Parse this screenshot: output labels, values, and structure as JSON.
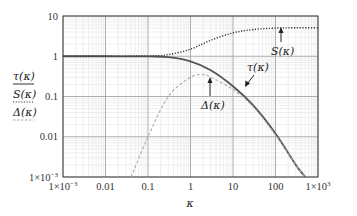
{
  "chart_data": {
    "type": "line",
    "title": "",
    "xlabel": "κ",
    "ylabel": "",
    "xscale": "log",
    "yscale": "log",
    "xlim": [
      0.001,
      1000
    ],
    "ylim": [
      0.001,
      10
    ],
    "grid": "major and minor",
    "x_ticks": [
      "1×10⁻³",
      "0.01",
      "0.1",
      "1",
      "10",
      "100",
      "1×10³"
    ],
    "y_ticks": [
      "10",
      "1",
      "0.1",
      "0.01",
      "1×10⁻³"
    ],
    "legend": {
      "position": "left of axes",
      "entries": [
        {
          "label": "τ(κ)",
          "style": "solid"
        },
        {
          "label": "S(κ)",
          "style": "dotted"
        },
        {
          "label": "Δ(κ)",
          "style": "dashed"
        }
      ]
    },
    "series": [
      {
        "name": "τ(κ)",
        "style": "solid",
        "color": "#555555",
        "x": [
          0.001,
          0.01,
          0.1,
          0.3,
          1,
          3,
          10,
          30,
          100,
          300,
          500
        ],
        "y": [
          1,
          1,
          0.99,
          0.95,
          0.75,
          0.45,
          0.18,
          0.06,
          0.012,
          0.002,
          0.001
        ]
      },
      {
        "name": "S(κ)",
        "style": "dotted",
        "color": "#333333",
        "x": [
          0.001,
          0.1,
          0.3,
          1,
          3,
          10,
          30,
          100,
          300,
          1000
        ],
        "y": [
          1,
          1.02,
          1.1,
          1.5,
          2.5,
          3.8,
          4.6,
          5.0,
          5.1,
          5.1
        ]
      },
      {
        "name": "Δ(κ)",
        "style": "dashed",
        "color": "#aaaaaa",
        "x": [
          0.04,
          0.1,
          0.3,
          1,
          2,
          3,
          10,
          30,
          100,
          300,
          500
        ],
        "y": [
          0.001,
          0.01,
          0.1,
          0.3,
          0.35,
          0.3,
          0.15,
          0.055,
          0.011,
          0.002,
          0.001
        ]
      }
    ],
    "annotations": [
      {
        "text": "S(κ)",
        "arrow_to": [
          100,
          5.0
        ]
      },
      {
        "text": "τ(κ)",
        "arrow_to": [
          10,
          0.2
        ]
      },
      {
        "text": "Δ(κ)",
        "arrow_to": [
          2,
          0.35
        ]
      }
    ]
  },
  "labels": {
    "xlabel": "κ",
    "x_ticks": [
      "1×10",
      "0.01",
      "0.1",
      "1",
      "10",
      "100",
      "1×10"
    ],
    "x_tick_sup": [
      "−3",
      "",
      "",
      "",
      "",
      "",
      "3"
    ],
    "y_ticks": [
      "10",
      "1",
      "0.1",
      "0.01",
      "1×10"
    ],
    "y_tick_sup": [
      "",
      "",
      "",
      "",
      "−3"
    ],
    "legend": [
      "τ(κ)",
      "S(κ)",
      "Δ(κ)"
    ],
    "annot_S": "S(κ)",
    "annot_tau": "τ(κ)",
    "annot_delta": "Δ(κ)"
  }
}
